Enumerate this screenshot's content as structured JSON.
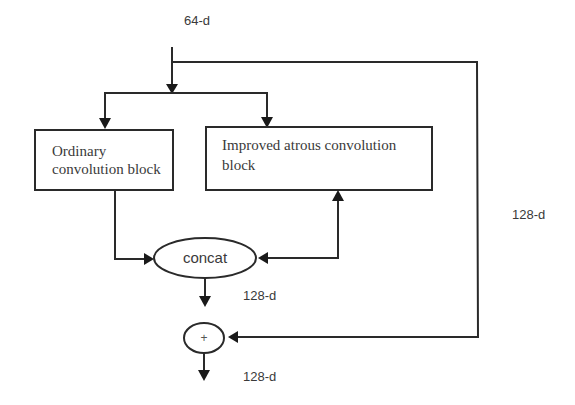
{
  "diagram": {
    "input_label": "64-d",
    "skip_label": "128-d",
    "concat_output_label": "128-d",
    "final_output_label": "128-d",
    "nodes": {
      "ordinary_block": {
        "line1": "Ordinary",
        "line2": "convolution block"
      },
      "atrous_block": {
        "line1": "Improved atrous convolution",
        "line2": "block"
      },
      "concat": {
        "label": "concat"
      },
      "add": {
        "label": "+"
      }
    },
    "edges": [
      {
        "from": "input",
        "to": "ordinary_block"
      },
      {
        "from": "input",
        "to": "atrous_block"
      },
      {
        "from": "input",
        "to": "add",
        "label": "128-d"
      },
      {
        "from": "ordinary_block",
        "to": "concat"
      },
      {
        "from": "concat",
        "to": "atrous_block"
      },
      {
        "from": "atrous_block",
        "to": "concat"
      },
      {
        "from": "concat",
        "to": "add",
        "label": "128-d"
      },
      {
        "from": "add",
        "to": "output",
        "label": "128-d"
      }
    ],
    "colors": {
      "stroke": "#2a2a2a",
      "text": "#3a3a3a",
      "background": "#ffffff"
    }
  }
}
